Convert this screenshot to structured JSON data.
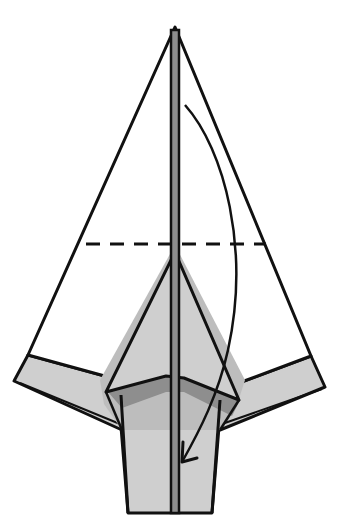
{
  "diagram": {
    "type": "origami-fold-step",
    "colors": {
      "background": "#ffffff",
      "paper_front": "#ffffff",
      "paper_back": "#cfcfcf",
      "shadow_light": "#bdbdbd",
      "shadow_dark": "#8e8e8e",
      "line": "#111111"
    },
    "elements": [
      {
        "name": "top-triangle-flap",
        "description": "large white triangular flap pointing up"
      },
      {
        "name": "valley-fold-line",
        "description": "horizontal dashed line across the triangle"
      },
      {
        "name": "center-spine",
        "description": "vertical center crease/spine"
      },
      {
        "name": "inner-kite-layer",
        "description": "grey inner kite-shaped layer"
      },
      {
        "name": "left-wing-strip",
        "description": "grey folded strip on left"
      },
      {
        "name": "right-wing-strip",
        "description": "grey folded strip on right"
      },
      {
        "name": "body-tail",
        "description": "grey body extending downward"
      },
      {
        "name": "fold-arrow",
        "description": "curved arrow indicating fold the tip down"
      }
    ],
    "instruction": "Valley fold the top point down along the dashed line"
  }
}
